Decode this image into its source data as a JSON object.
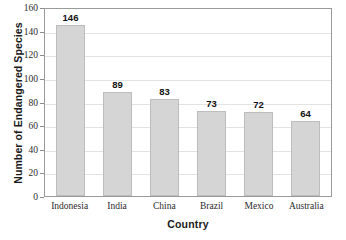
{
  "chart_data": {
    "type": "bar",
    "title": "",
    "subtitle": "",
    "xlabel": "Country",
    "ylabel": "Number of Endangered Species",
    "categories": [
      "Indonesia",
      "India",
      "China",
      "Brazil",
      "Mexico",
      "Australia"
    ],
    "values": [
      146,
      89,
      83,
      73,
      72,
      64
    ],
    "value_labels": [
      "146",
      "89",
      "83",
      "73",
      "72",
      "64"
    ],
    "ylim": [
      0,
      160
    ],
    "ytick_values": [
      0,
      20,
      40,
      60,
      80,
      100,
      120,
      140,
      160
    ],
    "ytick_labels": [
      "0",
      "20",
      "40",
      "60",
      "80",
      "100",
      "120",
      "140",
      "160"
    ],
    "grid": "horizontal",
    "legend": "none",
    "colors": {
      "bar_fill": "#d5d5d5",
      "bar_edge": "#bdbdbd",
      "gridline": "#e3e3e3",
      "frame": "#9a9a9a",
      "text": "#1a1a1a",
      "background": "#ffffff"
    }
  }
}
